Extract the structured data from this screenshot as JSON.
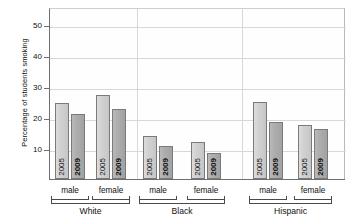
{
  "chart_data": {
    "type": "bar",
    "title": "",
    "xlabel": "",
    "ylabel": "Percentage of students smoking",
    "ylim": [
      0,
      55
    ],
    "yticks": [
      10,
      20,
      30,
      40,
      50
    ],
    "grid": true,
    "legend_position": "none",
    "categories": [
      "White male",
      "White female",
      "Black male",
      "Black female",
      "Hispanic male",
      "Hispanic female"
    ],
    "groups": [
      {
        "race": "White",
        "sexes": [
          {
            "sex": "male",
            "bars": [
              {
                "year": "2005",
                "value": 24.5
              },
              {
                "year": "2009",
                "value": 21.0
              }
            ]
          },
          {
            "sex": "female",
            "bars": [
              {
                "year": "2005",
                "value": 27.0
              },
              {
                "year": "2009",
                "value": 22.5
              }
            ]
          }
        ]
      },
      {
        "race": "Black",
        "sexes": [
          {
            "sex": "male",
            "bars": [
              {
                "year": "2005",
                "value": 14.0
              },
              {
                "year": "2009",
                "value": 10.5
              }
            ]
          },
          {
            "sex": "female",
            "bars": [
              {
                "year": "2005",
                "value": 12.0
              },
              {
                "year": "2009",
                "value": 8.5
              }
            ]
          }
        ]
      },
      {
        "race": "Hispanic",
        "sexes": [
          {
            "sex": "male",
            "bars": [
              {
                "year": "2005",
                "value": 24.8
              },
              {
                "year": "2009",
                "value": 18.5
              }
            ]
          },
          {
            "sex": "female",
            "bars": [
              {
                "year": "2005",
                "value": 17.5
              },
              {
                "year": "2009",
                "value": 16.0
              }
            ]
          }
        ]
      }
    ],
    "series": [
      {
        "name": "2005",
        "values": [
          24.5,
          27.0,
          14.0,
          12.0,
          24.8,
          17.5
        ]
      },
      {
        "name": "2009",
        "values": [
          21.0,
          22.5,
          10.5,
          8.5,
          18.5,
          16.0
        ]
      }
    ],
    "colors": {
      "y2005": "#d2d2d2",
      "y2009": "#aeaeae",
      "axis": "#6f6f6f",
      "grid": "#d8d8d8"
    }
  }
}
